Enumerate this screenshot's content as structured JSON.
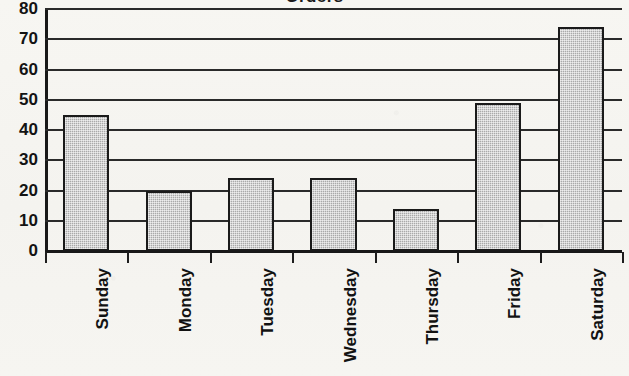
{
  "chart_data": {
    "type": "bar",
    "title": "Orders",
    "xlabel": "",
    "ylabel": "",
    "categories": [
      "Sunday",
      "Monday",
      "Tuesday",
      "Wednesday",
      "Thursday",
      "Friday",
      "Saturday"
    ],
    "values": [
      45,
      20,
      24,
      24,
      14,
      49,
      74
    ],
    "ylim": [
      0,
      80
    ],
    "y_ticks": [
      0,
      10,
      20,
      30,
      40,
      50,
      60,
      70,
      80
    ],
    "y_tick_labels": [
      "0",
      "10",
      "20",
      "30",
      "40",
      "50",
      "60",
      "70",
      "80"
    ],
    "grid": true,
    "legend": false,
    "legend_position": "none",
    "bar_fill_color": "#a9a9a9",
    "bar_edge_color": "#1a1a1a",
    "axis_color": "#181818",
    "background_color": "#f6f5f1",
    "text_color": "#121212",
    "x_tick_label_rotation": 90,
    "note_title_clipped": true
  }
}
